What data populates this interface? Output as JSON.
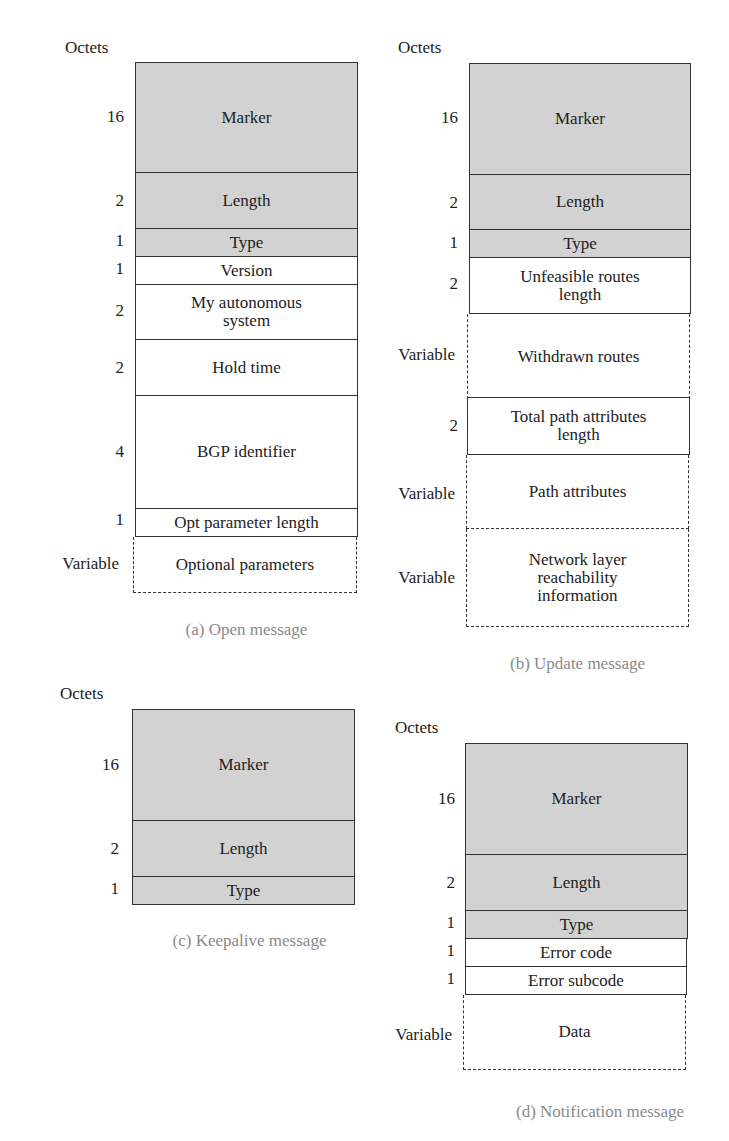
{
  "octets_label": "Octets",
  "diagrams": [
    {
      "id": "a",
      "caption": "(a) Open message",
      "fields": [
        {
          "label": "Marker",
          "size": "16"
        },
        {
          "label": "Length",
          "size": "2"
        },
        {
          "label": "Type",
          "size": "1"
        },
        {
          "label": "Version",
          "size": "1"
        },
        {
          "label": "My autonomous system",
          "size": "2"
        },
        {
          "label": "Hold time",
          "size": "2"
        },
        {
          "label": "BGP identifier",
          "size": "4"
        },
        {
          "label": "Opt parameter length",
          "size": "1"
        },
        {
          "label": "Optional parameters",
          "size": "Variable"
        }
      ]
    },
    {
      "id": "b",
      "caption": "(b) Update message",
      "fields": [
        {
          "label": "Marker",
          "size": "16"
        },
        {
          "label": "Length",
          "size": "2"
        },
        {
          "label": "Type",
          "size": "1"
        },
        {
          "label": "Unfeasible routes length",
          "size": "2"
        },
        {
          "label": "Withdrawn routes",
          "size": "Variable"
        },
        {
          "label": "Total path attributes length",
          "size": "2"
        },
        {
          "label": "Path attributes",
          "size": "Variable"
        },
        {
          "label": "Network layer reachability information",
          "size": "Variable"
        }
      ]
    },
    {
      "id": "c",
      "caption": "(c) Keepalive message",
      "fields": [
        {
          "label": "Marker",
          "size": "16"
        },
        {
          "label": "Length",
          "size": "2"
        },
        {
          "label": "Type",
          "size": "1"
        }
      ]
    },
    {
      "id": "d",
      "caption": "(d) Notification message",
      "fields": [
        {
          "label": "Marker",
          "size": "16"
        },
        {
          "label": "Length",
          "size": "2"
        },
        {
          "label": "Type",
          "size": "1"
        },
        {
          "label": "Error code",
          "size": "1"
        },
        {
          "label": "Error subcode",
          "size": "1"
        },
        {
          "label": "Data",
          "size": "Variable"
        }
      ]
    }
  ],
  "colors": {
    "header_fill": "#d2d2d2",
    "line": "#333333",
    "caption": "#8a8a8a"
  }
}
